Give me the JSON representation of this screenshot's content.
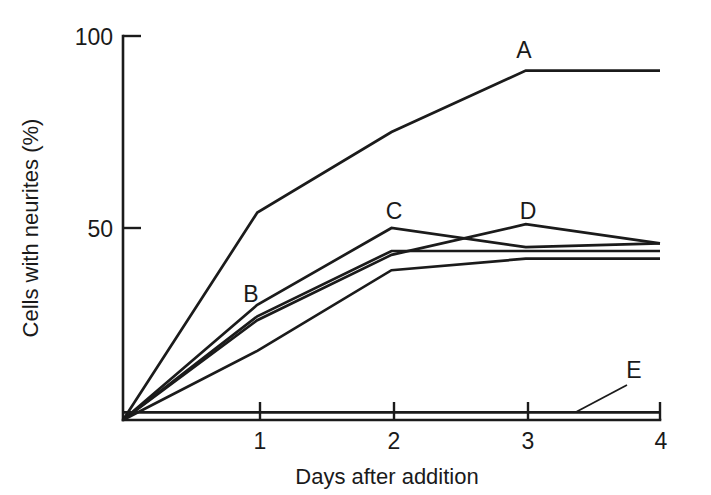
{
  "chart_data": {
    "type": "line",
    "title": "",
    "xlabel": "Days after addition",
    "ylabel": "Cells with neurites (%)",
    "xlim": [
      0,
      4
    ],
    "ylim": [
      0,
      100
    ],
    "xticks": [
      "1",
      "2",
      "3",
      "4"
    ],
    "xtick_values": [
      1,
      2,
      3,
      4
    ],
    "yticks": [
      "50",
      "100"
    ],
    "ytick_values": [
      50,
      100
    ],
    "grid": false,
    "legend_position": "inline-labels",
    "x": [
      0,
      1,
      2,
      3,
      4
    ],
    "series": [
      {
        "name": "A",
        "label": "A",
        "values": [
          0,
          54,
          75,
          91,
          91
        ]
      },
      {
        "name": "C",
        "label": "C",
        "values": [
          0,
          30,
          50,
          45,
          46
        ]
      },
      {
        "name": "D",
        "label": "D",
        "values": [
          0,
          26,
          43,
          51,
          46
        ]
      },
      {
        "name": "B",
        "label": "B",
        "values": [
          0,
          27,
          44,
          44,
          44
        ]
      },
      {
        "name": "mid-plateau",
        "label": "",
        "values": [
          0,
          18,
          39,
          42,
          42
        ]
      },
      {
        "name": "E",
        "label": "E",
        "values": [
          2,
          2,
          2,
          2,
          2
        ]
      }
    ]
  },
  "labels": {
    "y_axis_title": "Cells with neurites (%)",
    "x_axis_title": "Days after addition",
    "y_tick_100": "100",
    "y_tick_50": "50",
    "x_tick_1": "1",
    "x_tick_2": "2",
    "x_tick_3": "3",
    "x_tick_4": "4",
    "curve_a": "A",
    "curve_b": "B",
    "curve_c": "C",
    "curve_d": "D",
    "curve_e": "E"
  },
  "colors": {
    "ink": "#1b1b1b",
    "background": "#ffffff"
  }
}
